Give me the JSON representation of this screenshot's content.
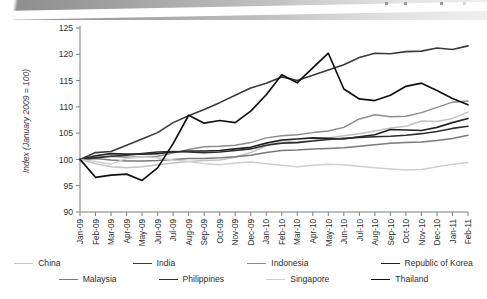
{
  "page": {
    "artifact_band": "scanned-page-edge"
  },
  "chart_data": {
    "type": "line",
    "title": "",
    "xlabel": "",
    "ylabel": "Index (January 2009 = 100)",
    "ylim": [
      90,
      125
    ],
    "yticks": [
      90,
      95,
      100,
      105,
      110,
      115,
      120,
      125
    ],
    "grid": false,
    "legend_position": "bottom",
    "categories": [
      "Jan-09",
      "Feb-09",
      "Mar-09",
      "Apr-09",
      "May-09",
      "Jun-09",
      "Jul-09",
      "Aug-09",
      "Sep-09",
      "Oct-09",
      "Nov-09",
      "Dec-09",
      "Jan-10",
      "Feb-10",
      "Mar-10",
      "Apr-10",
      "May-10",
      "Jun-10",
      "Jul-10",
      "Aug-10",
      "Sep-10",
      "Oct-10",
      "Nov-10",
      "Dec-10",
      "Jan-11",
      "Feb-11"
    ],
    "series": [
      {
        "name": "China",
        "color": "#c2c2c2",
        "width": 1.5,
        "values": [
          100.0,
          99.2,
          98.6,
          98.4,
          98.6,
          99.0,
          99.3,
          99.6,
          99.8,
          99.9,
          100.4,
          101.3,
          102.6,
          103.6,
          103.3,
          103.6,
          104.1,
          104.5,
          104.9,
          105.4,
          106.0,
          106.3,
          107.3,
          107.2,
          107.8,
          109.0
        ]
      },
      {
        "name": "India",
        "color": "#3a3a3a",
        "width": 1.6,
        "values": [
          100.0,
          101.3,
          101.5,
          102.7,
          103.9,
          105.1,
          107.0,
          108.3,
          109.5,
          110.8,
          112.2,
          113.6,
          114.5,
          115.7,
          115.0,
          116.0,
          117.0,
          118.0,
          119.4,
          120.2,
          120.1,
          120.5,
          120.6,
          121.2,
          120.9,
          121.6
        ]
      },
      {
        "name": "Indonesia",
        "color": "#8c8c8c",
        "width": 1.5,
        "values": [
          100.0,
          100.4,
          100.6,
          100.4,
          100.5,
          100.6,
          101.2,
          101.9,
          102.4,
          102.5,
          102.7,
          103.2,
          104.1,
          104.5,
          104.7,
          105.1,
          105.4,
          106.1,
          107.7,
          108.5,
          108.1,
          108.2,
          108.9,
          109.9,
          110.9,
          111.1
        ]
      },
      {
        "name": "Republic of Korea",
        "color": "#222222",
        "width": 1.6,
        "values": [
          100.0,
          100.7,
          101.1,
          101.0,
          101.0,
          101.1,
          101.4,
          101.6,
          101.6,
          101.7,
          102.0,
          102.3,
          103.1,
          103.7,
          103.9,
          104.1,
          104.0,
          103.9,
          104.3,
          104.7,
          105.7,
          105.6,
          105.5,
          106.1,
          107.0,
          107.8
        ]
      },
      {
        "name": "Malaysia",
        "color": "#7a7a7a",
        "width": 1.5,
        "values": [
          100.0,
          100.2,
          99.9,
          99.7,
          99.7,
          99.8,
          100.0,
          100.2,
          100.2,
          100.3,
          100.5,
          100.8,
          101.3,
          101.7,
          101.8,
          102.0,
          102.1,
          102.2,
          102.5,
          102.8,
          103.1,
          103.2,
          103.3,
          103.6,
          104.0,
          104.6
        ]
      },
      {
        "name": "Philippines",
        "color": "#2e2e2e",
        "width": 1.6,
        "values": [
          100.0,
          100.3,
          100.6,
          100.8,
          101.1,
          101.4,
          101.5,
          101.4,
          101.3,
          101.4,
          101.7,
          102.0,
          102.7,
          103.1,
          103.2,
          103.5,
          103.8,
          104.0,
          104.2,
          104.3,
          104.4,
          104.6,
          104.9,
          105.3,
          105.9,
          106.3
        ]
      },
      {
        "name": "Singapore",
        "color": "#cfcfcf",
        "width": 1.5,
        "values": [
          100.0,
          99.6,
          99.1,
          100.2,
          100.5,
          100.3,
          99.9,
          99.6,
          99.2,
          99.0,
          99.3,
          99.5,
          99.2,
          98.9,
          98.6,
          98.9,
          99.1,
          99.0,
          98.7,
          98.4,
          98.2,
          98.0,
          98.1,
          98.6,
          99.1,
          99.4
        ]
      },
      {
        "name": "Thailand",
        "color": "#111111",
        "width": 1.7,
        "values": [
          100.0,
          96.6,
          97.0,
          97.2,
          96.0,
          98.4,
          103.0,
          108.4,
          106.9,
          107.4,
          107.0,
          109.2,
          112.3,
          116.1,
          114.6,
          117.4,
          120.2,
          113.4,
          111.5,
          111.2,
          112.2,
          113.9,
          114.5,
          113.1,
          111.6,
          110.4
        ]
      }
    ]
  },
  "legend": {
    "rows": [
      [
        {
          "label": "China",
          "color": "#c2c2c2",
          "width": 1.5
        },
        {
          "label": "India",
          "color": "#3a3a3a",
          "width": 1.8
        },
        {
          "label": "Indonesia",
          "color": "#8c8c8c",
          "width": 1.5
        },
        {
          "label": "Republic of Korea",
          "color": "#222222",
          "width": 1.8
        }
      ],
      [
        {
          "label": "Malaysia",
          "color": "#7a7a7a",
          "width": 1.6
        },
        {
          "label": "Philippines",
          "color": "#2e2e2e",
          "width": 1.8
        },
        {
          "label": "Singapore",
          "color": "#cfcfcf",
          "width": 1.5
        },
        {
          "label": "Thailand",
          "color": "#111111",
          "width": 1.8
        }
      ]
    ]
  }
}
